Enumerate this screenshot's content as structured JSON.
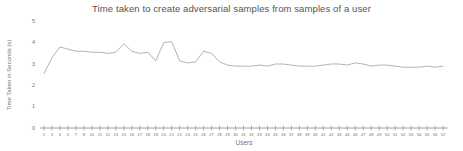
{
  "chart": {
    "title": "Time taken to create adversarial samples from samples of a user",
    "ylabel": "Time Taken in Seconds (s)",
    "xlabel": "Users"
  },
  "chart_data": {
    "type": "line",
    "title": "Time taken to create adversarial samples from samples of a user",
    "xlabel": "Users",
    "ylabel": "Time Taken in Seconds (s)",
    "x": [
      2,
      3,
      4,
      5,
      7,
      8,
      10,
      11,
      12,
      13,
      15,
      16,
      17,
      18,
      19,
      20,
      21,
      22,
      24,
      25,
      26,
      27,
      28,
      29,
      30,
      31,
      32,
      33,
      34,
      35,
      36,
      37,
      38,
      39,
      40,
      41,
      42,
      43,
      44,
      46,
      47,
      48,
      49,
      50,
      51,
      52,
      53,
      54,
      55,
      56,
      57
    ],
    "values": [
      2.55,
      3.3,
      3.8,
      3.7,
      3.6,
      3.6,
      3.55,
      3.55,
      3.5,
      3.55,
      3.95,
      3.6,
      3.5,
      3.55,
      3.15,
      4.0,
      4.05,
      3.15,
      3.05,
      3.1,
      3.6,
      3.5,
      3.1,
      2.95,
      2.9,
      2.9,
      2.9,
      2.95,
      2.9,
      3.0,
      3.0,
      2.95,
      2.9,
      2.9,
      2.9,
      2.95,
      3.0,
      3.0,
      2.95,
      3.05,
      3.0,
      2.9,
      2.95,
      2.95,
      2.9,
      2.85,
      2.85,
      2.85,
      2.9,
      2.85,
      2.9
    ],
    "yticks": [
      0,
      1,
      2,
      3,
      4,
      5
    ],
    "ylim": [
      0,
      5
    ],
    "grid": false,
    "legend": null,
    "colors": {
      "line": "#b3b3b3",
      "axis": "#9e9e9e",
      "tick_text": "#757575",
      "title_text": "#545454",
      "background": "#ffffff"
    }
  }
}
